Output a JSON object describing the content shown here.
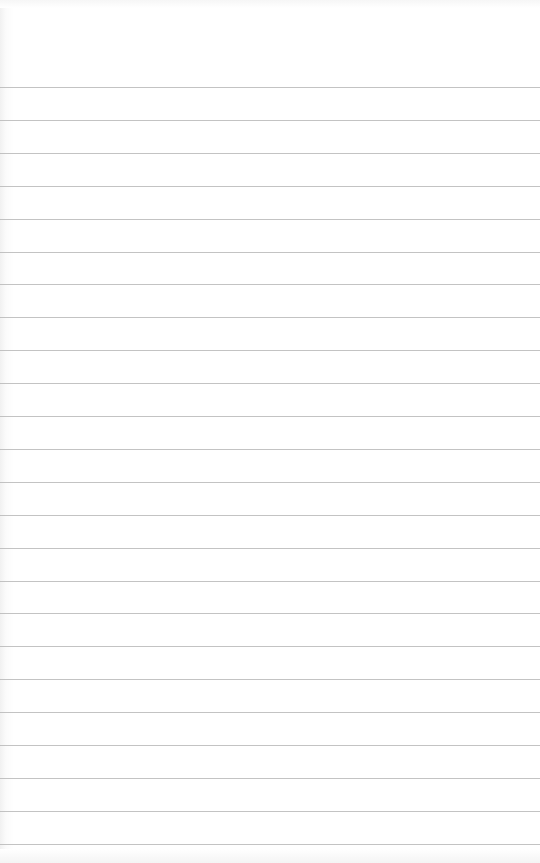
{
  "page": {
    "type": "lined-paper",
    "background_color": "#ffffff",
    "rule_color": "#b9b9b9",
    "rules": {
      "count": 24,
      "first_y": 87,
      "spacing": 32.9
    }
  }
}
